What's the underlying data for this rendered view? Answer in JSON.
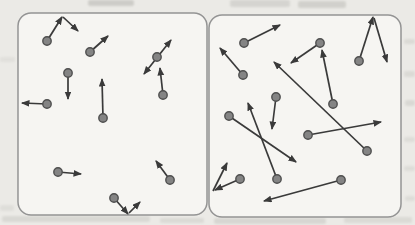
{
  "figure": {
    "type": "gas-molecule-velocity-diagram",
    "panel_ids": [
      "left-gas-box",
      "right-gas-box"
    ]
  },
  "colors": {
    "page_background": "#ebeae6",
    "box_fill": "#f6f5f2",
    "box_border": "#949494",
    "arrow": "#3a3a3a",
    "dot_fill": "#848484",
    "dot_stroke": "#4f4f4f",
    "smudge": "#8a8a84"
  },
  "diagram": {
    "width": 415,
    "height": 225,
    "dot_radius": 4.2,
    "panels": [
      {
        "id": "left-gas-box",
        "x": 18,
        "y": 13,
        "width": 189,
        "height": 202,
        "corner_radius": 13,
        "molecules": [
          {
            "dot": [
              47,
              41
            ],
            "arrows": [
              {
                "from": [
                  47,
                  41
                ],
                "to": [
                  62,
                  17
                ]
              },
              {
                "from": [
                  63,
                  17
                ],
                "to": [
                  78,
                  31
                ]
              }
            ]
          },
          {
            "dot": [
              90,
              52
            ],
            "arrows": [
              {
                "from": [
                  90,
                  52
                ],
                "to": [
                  108,
                  36
                ]
              }
            ]
          },
          {
            "dot": [
              157,
              57
            ],
            "arrows": [
              {
                "from": [
                  144,
                  74
                ],
                "to": [
                  171,
                  40
                ],
                "both_heads": true
              }
            ]
          },
          {
            "dot": [
              163,
              95
            ],
            "arrows": [
              {
                "from": [
                  163,
                  95
                ],
                "to": [
                  160,
                  68
                ]
              }
            ]
          },
          {
            "dot": [
              68,
              73
            ],
            "arrows": [
              {
                "from": [
                  68,
                  73
                ],
                "to": [
                  68,
                  99
                ]
              }
            ]
          },
          {
            "dot": [
              47,
              104
            ],
            "arrows": [
              {
                "from": [
                  47,
                  104
                ],
                "to": [
                  22,
                  103
                ]
              }
            ]
          },
          {
            "dot": [
              103,
              118
            ],
            "arrows": [
              {
                "from": [
                  103,
                  118
                ],
                "to": [
                  102,
                  79
                ]
              }
            ]
          },
          {
            "dot": [
              58,
              172
            ],
            "arrows": [
              {
                "from": [
                  58,
                  172
                ],
                "to": [
                  81,
                  174
                ]
              }
            ]
          },
          {
            "dot": [
              170,
              180
            ],
            "arrows": [
              {
                "from": [
                  170,
                  180
                ],
                "to": [
                  156,
                  161
                ]
              }
            ]
          },
          {
            "dot": [
              114,
              198
            ],
            "arrows": [
              {
                "from": [
                  114,
                  198
                ],
                "to": [
                  128,
                  214
                ]
              },
              {
                "from": [
                  129,
                  213
                ],
                "to": [
                  140,
                  202
                ]
              }
            ]
          }
        ]
      },
      {
        "id": "right-gas-box",
        "x": 209,
        "y": 15,
        "width": 192,
        "height": 202,
        "corner_radius": 13,
        "molecules": [
          {
            "dot": [
              244,
              43
            ],
            "arrows": [
              {
                "from": [
                  244,
                  43
                ],
                "to": [
                  280,
                  25
                ]
              }
            ]
          },
          {
            "dot": [
              243,
              75
            ],
            "arrows": [
              {
                "from": [
                  243,
                  75
                ],
                "to": [
                  220,
                  48
                ]
              }
            ]
          },
          {
            "dot": [
              320,
              43
            ],
            "arrows": [
              {
                "from": [
                  320,
                  43
                ],
                "to": [
                  291,
                  63
                ]
              }
            ]
          },
          {
            "dot": [
              333,
              104
            ],
            "arrows": [
              {
                "from": [
                  333,
                  104
                ],
                "to": [
                  322,
                  50
                ]
              }
            ]
          },
          {
            "dot": [
              359,
              61
            ],
            "arrows": [
              {
                "from": [
                  359,
                  61
                ],
                "to": [
                  373,
                  17
                ]
              },
              {
                "from": [
                  374,
                  18
                ],
                "to": [
                  387,
                  62
                ]
              }
            ]
          },
          {
            "dot": [
              367,
              151
            ],
            "arrows": [
              {
                "from": [
                  367,
                  151
                ],
                "to": [
                  274,
                  62
                ]
              }
            ]
          },
          {
            "dot": [
              229,
              116
            ],
            "arrows": [
              {
                "from": [
                  229,
                  116
                ],
                "to": [
                  296,
                  162
                ]
              }
            ]
          },
          {
            "dot": [
              276,
              97
            ],
            "arrows": [
              {
                "from": [
                  276,
                  97
                ],
                "to": [
                  272,
                  129
                ]
              }
            ]
          },
          {
            "dot": [
              308,
              135
            ],
            "arrows": [
              {
                "from": [
                  308,
                  135
                ],
                "to": [
                  381,
                  122
                ]
              }
            ]
          },
          {
            "dot": [
              277,
              179
            ],
            "arrows": [
              {
                "from": [
                  277,
                  179
                ],
                "to": [
                  248,
                  103
                ]
              }
            ]
          },
          {
            "dot": [
              240,
              179
            ],
            "arrows": [
              {
                "from": [
                  240,
                  179
                ],
                "to": [
                  215,
                  190
                ]
              },
              {
                "from": [
                  213,
                  191
                ],
                "to": [
                  227,
                  163
                ]
              }
            ]
          },
          {
            "dot": [
              341,
              180
            ],
            "arrows": [
              {
                "from": [
                  341,
                  180
                ],
                "to": [
                  264,
                  201
                ]
              }
            ]
          }
        ]
      }
    ],
    "scan_artifacts": [
      {
        "x": 88,
        "y": 0,
        "w": 46,
        "h": 6,
        "opacity": 0.3
      },
      {
        "x": 230,
        "y": 0,
        "w": 60,
        "h": 7,
        "opacity": 0.22
      },
      {
        "x": 298,
        "y": 1,
        "w": 48,
        "h": 7,
        "opacity": 0.26
      },
      {
        "x": 404,
        "y": 39,
        "w": 11,
        "h": 5,
        "opacity": 0.16
      },
      {
        "x": 404,
        "y": 71,
        "w": 11,
        "h": 6,
        "opacity": 0.16
      },
      {
        "x": 405,
        "y": 100,
        "w": 10,
        "h": 6,
        "opacity": 0.18
      },
      {
        "x": 404,
        "y": 137,
        "w": 11,
        "h": 5,
        "opacity": 0.14
      },
      {
        "x": 404,
        "y": 166,
        "w": 11,
        "h": 5,
        "opacity": 0.14
      },
      {
        "x": 405,
        "y": 196,
        "w": 10,
        "h": 5,
        "opacity": 0.14
      },
      {
        "x": 0,
        "y": 57,
        "w": 15,
        "h": 5,
        "opacity": 0.1
      },
      {
        "x": 0,
        "y": 205,
        "w": 14,
        "h": 6,
        "opacity": 0.12
      },
      {
        "x": 2,
        "y": 216,
        "w": 148,
        "h": 6,
        "opacity": 0.18
      },
      {
        "x": 160,
        "y": 218,
        "w": 44,
        "h": 5,
        "opacity": 0.16
      },
      {
        "x": 214,
        "y": 218,
        "w": 112,
        "h": 6,
        "opacity": 0.2
      },
      {
        "x": 344,
        "y": 217,
        "w": 68,
        "h": 6,
        "opacity": 0.16
      }
    ]
  }
}
